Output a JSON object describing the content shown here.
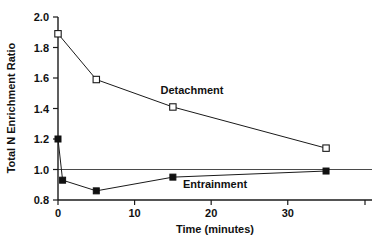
{
  "chart_data": {
    "type": "line",
    "title": "",
    "subtitle": "",
    "xlabel": "Time (minutes)",
    "ylabel": "Total N Enrichment Ratio",
    "xlim": [
      0,
      41
    ],
    "ylim": [
      0.8,
      2.0
    ],
    "xticks": [
      0,
      10,
      20,
      30
    ],
    "xticklabels": [
      "0",
      "10",
      "20",
      "30"
    ],
    "yticks": [
      0.8,
      1.0,
      1.2,
      1.4,
      1.6,
      1.8,
      2.0
    ],
    "yticklabels": [
      "0.8",
      "1.0",
      "1.2",
      "1.4",
      "1.6",
      "1.8",
      "2.0"
    ],
    "grid": false,
    "legend_position": "inline-annotation",
    "reference_lines": [
      {
        "axis": "y",
        "value": 1.0,
        "label": ""
      }
    ],
    "series": [
      {
        "name": "Detachment",
        "marker": "open-square",
        "x": [
          0,
          5,
          15,
          35
        ],
        "values": [
          1.89,
          1.59,
          1.41,
          1.14
        ],
        "label_x": 17.5,
        "label_y": 1.52
      },
      {
        "name": "Entrainment",
        "marker": "filled-square",
        "x": [
          0,
          0.6,
          5,
          15,
          35
        ],
        "values": [
          1.2,
          0.93,
          0.86,
          0.95,
          0.99
        ],
        "label_x": 20.5,
        "label_y": 0.905
      }
    ],
    "annotations": [
      {
        "text": "Detachment",
        "x": 17.5,
        "y": 1.52
      },
      {
        "text": "Entrainment",
        "x": 20.5,
        "y": 0.905
      }
    ]
  },
  "colors": {
    "axis": "#1a1a1a",
    "series_detachment": "#1a1a1a",
    "series_entrainment": "#111111",
    "reference_line": "#4a4a4a",
    "background": "#ffffff"
  }
}
